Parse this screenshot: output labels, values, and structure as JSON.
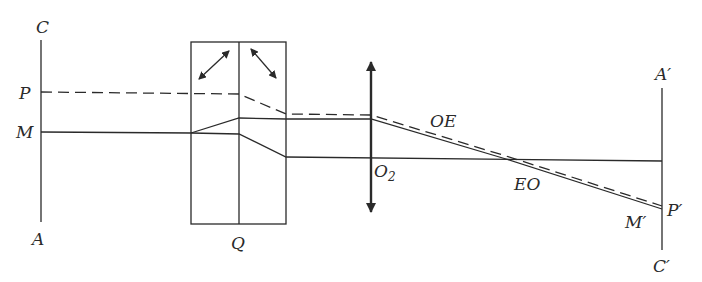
{
  "diagram": {
    "type": "optical-ray-diagram",
    "labels": {
      "C": "C",
      "P": "P",
      "M": "M",
      "A": "A",
      "Q": "Q",
      "O2": "O",
      "O2_sub": "2",
      "OE": "OE",
      "EO": "EO",
      "A_prime": "A′",
      "P_prime": "P′",
      "M_prime": "M′",
      "C_prime": "C′"
    },
    "components": [
      {
        "id": "object-plane",
        "label": "AC"
      },
      {
        "id": "prism",
        "label": "Q"
      },
      {
        "id": "lens",
        "label": "O2"
      },
      {
        "id": "image-plane",
        "label": "A′C′"
      }
    ],
    "rays": [
      {
        "id": "ray-P",
        "style": "dashed",
        "label": "OE"
      },
      {
        "id": "ray-M-upper",
        "style": "solid",
        "label": "OE"
      },
      {
        "id": "ray-M-lower",
        "style": "solid",
        "label": "EO"
      }
    ],
    "colors": {
      "ink": "#2a2a2a",
      "background": "#ffffff"
    }
  }
}
